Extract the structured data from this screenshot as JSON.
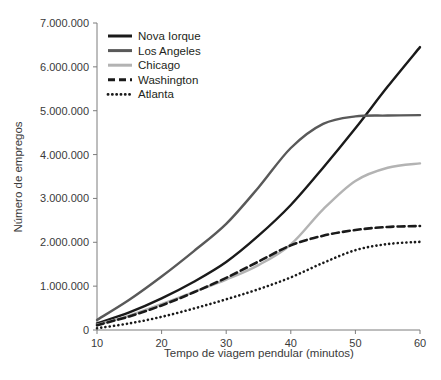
{
  "chart_data": {
    "type": "line",
    "title": "",
    "xlabel": "Tempo de viagem pendular (minutos)",
    "ylabel": "Número de empregos",
    "xlim": [
      10,
      60
    ],
    "ylim": [
      0,
      7000000
    ],
    "grid": false,
    "legend_position": "top-left",
    "xticks": [
      "10",
      "20",
      "30",
      "40",
      "50",
      "60"
    ],
    "xtick_values": [
      10,
      20,
      30,
      40,
      50,
      60
    ],
    "yticks": [
      "0",
      "1.000.000",
      "2.000.000",
      "3.000.000",
      "4.000.000",
      "5.000.000",
      "6.000.000",
      "7.000.000"
    ],
    "ytick_values": [
      0,
      1000000,
      2000000,
      3000000,
      4000000,
      5000000,
      6000000,
      7000000
    ],
    "x": [
      10,
      15,
      20,
      25,
      30,
      35,
      40,
      45,
      50,
      55,
      60
    ],
    "series": [
      {
        "name": "Nova Iorque",
        "color": "#1a1a1a",
        "style": "solid",
        "values": [
          150000,
          400000,
          720000,
          1100000,
          1550000,
          2150000,
          2850000,
          3700000,
          4600000,
          5550000,
          6450000
        ]
      },
      {
        "name": "Los Angeles",
        "color": "#595959",
        "style": "solid",
        "values": [
          230000,
          690000,
          1220000,
          1800000,
          2420000,
          3250000,
          4150000,
          4700000,
          4870000,
          4890000,
          4900000
        ]
      },
      {
        "name": "Chicago",
        "color": "#b3b3b3",
        "style": "solid",
        "values": [
          120000,
          330000,
          590000,
          870000,
          1150000,
          1480000,
          1950000,
          2750000,
          3400000,
          3700000,
          3800000
        ]
      },
      {
        "name": "Washington",
        "color": "#1a1a1a",
        "style": "dashed",
        "values": [
          110000,
          310000,
          560000,
          860000,
          1190000,
          1560000,
          1930000,
          2150000,
          2280000,
          2350000,
          2370000
        ]
      },
      {
        "name": "Atlanta",
        "color": "#1a1a1a",
        "style": "dotted",
        "values": [
          40000,
          150000,
          300000,
          490000,
          700000,
          930000,
          1200000,
          1530000,
          1820000,
          1960000,
          2010000
        ]
      }
    ]
  },
  "legend": {
    "items": [
      {
        "label": "Nova Iorque"
      },
      {
        "label": "Los Angeles"
      },
      {
        "label": "Chicago"
      },
      {
        "label": "Washington"
      },
      {
        "label": "Atlanta"
      }
    ]
  }
}
